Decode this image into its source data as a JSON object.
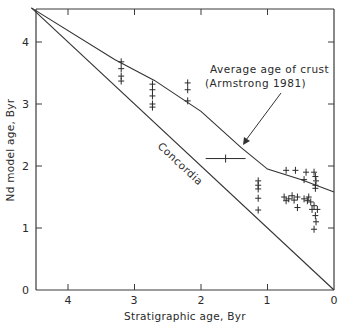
{
  "chart_data": {
    "type": "scatter",
    "title": "",
    "xlabel": "Stratigraphic age, Byr",
    "ylabel": "Nd model age, Byr",
    "xlim": [
      4.5,
      0
    ],
    "ylim": [
      0,
      4.55
    ],
    "x_ticks": [
      4,
      3,
      2,
      1,
      0
    ],
    "y_ticks": [
      0,
      1,
      2,
      3,
      4
    ],
    "grid": false,
    "legend": null,
    "lines": [
      {
        "name": "Concordia",
        "label": "Concordia",
        "points": [
          [
            4.55,
            4.55
          ],
          [
            0,
            0
          ]
        ]
      },
      {
        "name": "Average age of crust (Armstrong 1981)",
        "label_line1": "Average age of crust",
        "label_line2": "( Armstrong 1981 )",
        "points": [
          [
            4.55,
            4.55
          ],
          [
            3.3,
            3.72
          ],
          [
            2.7,
            3.38
          ],
          [
            2.0,
            2.88
          ],
          [
            1.4,
            2.3
          ],
          [
            1.0,
            1.95
          ],
          [
            0.5,
            1.78
          ],
          [
            0.0,
            1.58
          ]
        ]
      }
    ],
    "series": [
      {
        "name": "Nd model ages",
        "points": [
          [
            3.2,
            3.68
          ],
          [
            3.2,
            3.57
          ],
          [
            3.2,
            3.45
          ],
          [
            3.2,
            3.37
          ],
          [
            2.73,
            3.32
          ],
          [
            2.73,
            3.23
          ],
          [
            2.73,
            3.13
          ],
          [
            2.73,
            3.0
          ],
          [
            2.73,
            2.95
          ],
          [
            2.2,
            3.34
          ],
          [
            2.2,
            3.23
          ],
          [
            2.2,
            3.05
          ],
          [
            1.14,
            1.76
          ],
          [
            1.14,
            1.69
          ],
          [
            1.14,
            1.63
          ],
          [
            1.14,
            1.48
          ],
          [
            1.14,
            1.29
          ],
          [
            0.72,
            1.93
          ],
          [
            0.58,
            1.93
          ],
          [
            0.42,
            1.9
          ],
          [
            0.3,
            1.9
          ],
          [
            0.28,
            1.83
          ],
          [
            0.27,
            1.76
          ],
          [
            0.28,
            1.69
          ],
          [
            0.45,
            1.78
          ],
          [
            0.28,
            1.64
          ],
          [
            0.75,
            1.5
          ],
          [
            0.72,
            1.44
          ],
          [
            0.68,
            1.47
          ],
          [
            0.63,
            1.52
          ],
          [
            0.6,
            1.45
          ],
          [
            0.55,
            1.5
          ],
          [
            0.45,
            1.47
          ],
          [
            0.4,
            1.44
          ],
          [
            0.38,
            1.5
          ],
          [
            0.35,
            1.42
          ],
          [
            0.55,
            1.33
          ],
          [
            0.33,
            1.3
          ],
          [
            0.3,
            1.36
          ],
          [
            0.25,
            1.3
          ],
          [
            0.28,
            1.2
          ],
          [
            0.27,
            1.1
          ],
          [
            0.3,
            0.98
          ]
        ]
      }
    ],
    "error_bars": [
      {
        "x": 1.63,
        "y": 2.12,
        "xmin": 1.33,
        "xmax": 1.93
      }
    ],
    "annotations": [
      {
        "text": "Average age of crust",
        "arrow_to": [
          1.65,
          2.28
        ]
      },
      {
        "text": "( Armstrong 1981 )"
      },
      {
        "text": "Concordia",
        "rotated": true
      }
    ]
  },
  "labels": {
    "x_axis": "Stratigraphic age, Byr",
    "y_axis": "Nd model age, Byr",
    "crust_line1": "Average age of crust",
    "crust_line2": "(Armstrong 1981)",
    "concordia": "Concordia",
    "x_tick_4": "4",
    "x_tick_3": "3",
    "x_tick_2": "2",
    "x_tick_1": "1",
    "x_tick_0": "0",
    "y_tick_0": "0",
    "y_tick_1": "1",
    "y_tick_2": "2",
    "y_tick_3": "3",
    "y_tick_4": "4"
  }
}
